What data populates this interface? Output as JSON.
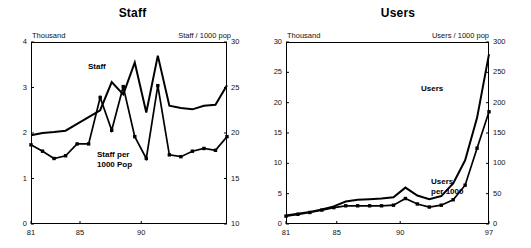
{
  "figure": {
    "panels": [
      {
        "id": "staff",
        "title": "Staff",
        "left_axis_note": "Thousand",
        "right_axis_note": "Staff / 1000 pop",
        "annotations": [
          {
            "name": "staff-line-label",
            "lines": [
              "Staff"
            ]
          },
          {
            "name": "staff-per-1000-label",
            "lines": [
              "Staff per",
              "1000 Pop"
            ]
          }
        ]
      },
      {
        "id": "users",
        "title": "Users",
        "left_axis_note": "Thousand",
        "right_axis_note": "Users / 1000 pop",
        "annotations": [
          {
            "name": "users-line-label",
            "lines": [
              "Users"
            ]
          },
          {
            "name": "users-per-1000-label",
            "lines": [
              "Users",
              "per 1000"
            ]
          }
        ]
      }
    ]
  },
  "chart_data": [
    {
      "type": "line",
      "title": "Staff",
      "xlabel": "",
      "ylabel": "Thousand",
      "y2label": "Staff / 1000 pop",
      "grid": false,
      "legend": "inline-annotations",
      "x": [
        81,
        82,
        83,
        84,
        85,
        86,
        87,
        88,
        89,
        90,
        91,
        92,
        93,
        94,
        95,
        96,
        97
      ],
      "xlim": [
        81,
        97
      ],
      "xticks": [
        81,
        85,
        90
      ],
      "xticklabels": [
        "81",
        "85",
        "90"
      ],
      "ylim": [
        0,
        4
      ],
      "yticks": [
        0,
        1,
        2,
        3,
        4
      ],
      "yticklabels": [
        "0",
        "1",
        "2",
        "3",
        "4"
      ],
      "y2lim": [
        10,
        30
      ],
      "y2ticks": [
        10,
        15,
        20,
        25,
        30
      ],
      "y2ticklabels": [
        "10",
        "15",
        "20",
        "25",
        "30"
      ],
      "series": [
        {
          "name": "Staff",
          "axis": "left",
          "units": "thousand",
          "markers": false,
          "values": [
            1.95,
            2.0,
            2.02,
            2.05,
            2.2,
            2.35,
            2.5,
            3.12,
            2.85,
            3.55,
            2.45,
            3.7,
            2.6,
            2.55,
            2.52,
            2.6,
            2.62,
            3.05
          ]
        },
        {
          "name": "Staff per 1000 Pop",
          "axis": "right",
          "units": "per 1000 population",
          "markers": true,
          "values": [
            18.7,
            18.0,
            17.2,
            17.5,
            18.8,
            18.8,
            23.9,
            20.3,
            25.1,
            19.6,
            17.2,
            25.2,
            17.6,
            17.4,
            18.0,
            18.3,
            18.1,
            19.6
          ]
        }
      ]
    },
    {
      "type": "line",
      "title": "Users",
      "xlabel": "",
      "ylabel": "Thousand",
      "y2label": "Users / 1000 pop",
      "grid": false,
      "legend": "inline-annotations",
      "x": [
        81,
        82,
        83,
        84,
        85,
        86,
        87,
        88,
        89,
        90,
        91,
        92,
        93,
        94,
        95,
        96,
        97
      ],
      "xlim": [
        81,
        97
      ],
      "xticks": [
        81,
        85,
        90,
        97
      ],
      "xticklabels": [
        "81",
        "85",
        "90",
        "97"
      ],
      "ylim": [
        0,
        30
      ],
      "yticks": [
        0,
        5,
        10,
        15,
        20,
        25,
        30
      ],
      "yticklabels": [
        "0",
        "5",
        "10",
        "15",
        "20",
        "25",
        "30"
      ],
      "y2lim": [
        0,
        300
      ],
      "y2ticks": [
        0,
        50,
        100,
        150,
        200,
        250,
        300
      ],
      "y2ticklabels": [
        "0",
        "50",
        "100",
        "150",
        "200",
        "250",
        "300"
      ],
      "series": [
        {
          "name": "Users",
          "axis": "left",
          "units": "thousand",
          "markers": false,
          "values": [
            1.4,
            1.7,
            2.0,
            2.4,
            2.9,
            3.7,
            4.0,
            4.1,
            4.2,
            4.4,
            6.0,
            4.7,
            4.1,
            4.6,
            6.7,
            10.5,
            17.5,
            28.0
          ]
        },
        {
          "name": "Users per 1000",
          "axis": "right",
          "units": "per 1000 population",
          "markers": true,
          "values": [
            13,
            16,
            19,
            23,
            27,
            30,
            30,
            30,
            30,
            31,
            42,
            33,
            28,
            31,
            40,
            64,
            125,
            185
          ]
        }
      ]
    }
  ]
}
